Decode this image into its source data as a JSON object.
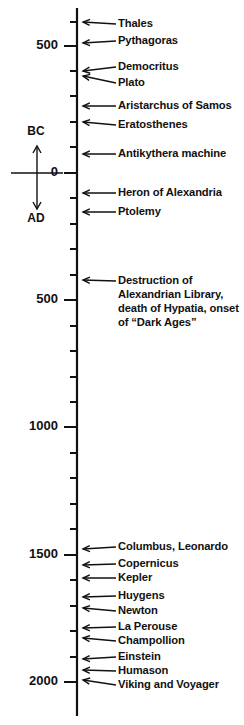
{
  "figure": {
    "kind": "timeline",
    "orientation": "vertical",
    "background_color": "#ffffff",
    "ink_color": "#111111"
  },
  "chart_data": {
    "type": "timeline",
    "title": "",
    "subtitle": "",
    "xlabel": "",
    "ylabel": "",
    "axis": {
      "orientation": "vertical",
      "direction": "top-is-oldest",
      "range_start_year": -700,
      "range_end_year": 2060,
      "unit": "year",
      "major_tick_interval": 500,
      "minor_tick_interval": 100,
      "grid": false,
      "legend": false,
      "era_divider_year": 0
    },
    "era_indicator": {
      "above_label": "BC",
      "below_label": "AD",
      "zero_label": "0"
    },
    "tick_labels": [
      {
        "label": "500",
        "year": -500,
        "major": true
      },
      {
        "label": "0",
        "year": 0,
        "major": true
      },
      {
        "label": "500",
        "year": 500,
        "major": true
      },
      {
        "label": "1000",
        "year": 1000,
        "major": true
      },
      {
        "label": "1500",
        "year": 1500,
        "major": true
      },
      {
        "label": "2000",
        "year": 2000,
        "major": true
      }
    ],
    "events": [
      {
        "label": "Thales",
        "year": -620,
        "lines": [
          "Thales"
        ]
      },
      {
        "label": "Pythagoras",
        "year": -550,
        "lines": [
          "Pythagoras"
        ]
      },
      {
        "label": "Democritus",
        "year": -440,
        "lines": [
          "Democritus"
        ]
      },
      {
        "label": "Plato",
        "year": -400,
        "lines": [
          "Plato"
        ]
      },
      {
        "label": "Aristarchus of Samos",
        "year": -280,
        "lines": [
          "Aristarchus of Samos"
        ]
      },
      {
        "label": "Eratosthenes",
        "year": -230,
        "lines": [
          "Eratosthenes"
        ]
      },
      {
        "label": "Antikythera machine",
        "year": -80,
        "lines": [
          "Antikythera machine"
        ]
      },
      {
        "label": "Heron of Alexandria",
        "year": 70,
        "lines": [
          "Heron of Alexandria"
        ]
      },
      {
        "label": "Ptolemy",
        "year": 150,
        "lines": [
          "Ptolemy"
        ]
      },
      {
        "label": "Destruction of Alexandrian Library, death of Hypatia, onset of “Dark Ages”",
        "year": 415,
        "lines": [
          "Destruction of",
          "Alexandrian Library,",
          "death of Hypatia, onset",
          "of “Dark Ages”"
        ]
      },
      {
        "label": "Columbus, Leonardo",
        "year": 1490,
        "lines": [
          "Columbus, Leonardo"
        ]
      },
      {
        "label": "Copernicus",
        "year": 1540,
        "lines": [
          "Copernicus"
        ]
      },
      {
        "label": "Kepler",
        "year": 1610,
        "lines": [
          "Kepler"
        ]
      },
      {
        "label": "Huygens",
        "year": 1670,
        "lines": [
          "Huygens"
        ]
      },
      {
        "label": "Newton",
        "year": 1690,
        "lines": [
          "Newton"
        ]
      },
      {
        "label": "La Perouse",
        "year": 1785,
        "lines": [
          "La Perouse"
        ]
      },
      {
        "label": "Champollion",
        "year": 1822,
        "lines": [
          "Champollion"
        ]
      },
      {
        "label": "Einstein",
        "year": 1915,
        "lines": [
          "Einstein"
        ]
      },
      {
        "label": "Humason",
        "year": 1930,
        "lines": [
          "Humason"
        ]
      },
      {
        "label": "Viking and Voyager",
        "year": 1977,
        "lines": [
          "Viking and Voyager"
        ]
      }
    ]
  },
  "layout": {
    "axis_x": 77,
    "axis_top_y": 8,
    "axis_bottom_y": 716,
    "year_zero_y": 173,
    "pixels_per_year": 0.2545,
    "major_tick_length": 13,
    "minor_tick_length": 7,
    "label_x": 118,
    "arrow_tip_x": 83,
    "arrow_tail_x": 116,
    "tick_text_x": 68
  },
  "rendered": {
    "ticks": [
      {
        "y": 22,
        "major": false
      },
      {
        "y": 46,
        "major": true,
        "text": "500",
        "text_y": 46
      },
      {
        "y": 71,
        "major": false
      },
      {
        "y": 96,
        "major": false
      },
      {
        "y": 122,
        "major": false
      },
      {
        "y": 147,
        "major": false
      },
      {
        "y": 173,
        "major": true,
        "text": "0",
        "text_y": 173
      },
      {
        "y": 198,
        "major": false
      },
      {
        "y": 224,
        "major": false
      },
      {
        "y": 249,
        "major": false
      },
      {
        "y": 275,
        "major": false
      },
      {
        "y": 300,
        "major": true,
        "text": "500",
        "text_y": 300
      },
      {
        "y": 326,
        "major": false
      },
      {
        "y": 351,
        "major": false
      },
      {
        "y": 377,
        "major": false
      },
      {
        "y": 402,
        "major": false
      },
      {
        "y": 427,
        "major": true,
        "text": "1000",
        "text_y": 427
      },
      {
        "y": 453,
        "major": false
      },
      {
        "y": 478,
        "major": false
      },
      {
        "y": 504,
        "major": false
      },
      {
        "y": 529,
        "major": false
      },
      {
        "y": 555,
        "major": true,
        "text": "1500",
        "text_y": 555
      },
      {
        "y": 580,
        "major": false
      },
      {
        "y": 606,
        "major": false
      },
      {
        "y": 631,
        "major": false
      },
      {
        "y": 657,
        "major": false
      },
      {
        "y": 682,
        "major": true,
        "text": "2000",
        "text_y": 682
      }
    ],
    "event_rows": [
      {
        "name": "thales",
        "tip_y": 22,
        "text_y": 24,
        "text_x": 118,
        "lines": [
          "Thales"
        ]
      },
      {
        "name": "pythagoras",
        "tip_y": 43,
        "text_y": 41,
        "text_x": 118,
        "lines": [
          "Pythagoras"
        ]
      },
      {
        "name": "democritus",
        "tip_y": 71,
        "text_y": 67,
        "text_x": 118,
        "lines": [
          "Democritus"
        ]
      },
      {
        "name": "plato",
        "tip_y": 76,
        "text_y": 83,
        "text_x": 118,
        "lines": [
          "Plato"
        ]
      },
      {
        "name": "aristarchus",
        "tip_y": 106,
        "text_y": 106,
        "text_x": 118,
        "lines": [
          "Aristarchus of Samos"
        ]
      },
      {
        "name": "eratosthenes",
        "tip_y": 122,
        "text_y": 125,
        "text_x": 118,
        "lines": [
          "Eratosthenes"
        ]
      },
      {
        "name": "antikythera",
        "tip_y": 154,
        "text_y": 154,
        "text_x": 118,
        "lines": [
          "Antikythera machine"
        ]
      },
      {
        "name": "heron",
        "tip_y": 193,
        "text_y": 193,
        "text_x": 118,
        "lines": [
          "Heron of Alexandria"
        ]
      },
      {
        "name": "ptolemy",
        "tip_y": 212,
        "text_y": 212,
        "text_x": 118,
        "lines": [
          "Ptolemy"
        ]
      },
      {
        "name": "alexandria",
        "tip_y": 280,
        "text_y": 281,
        "text_x": 118,
        "lines": [
          "Destruction of",
          "Alexandrian Library,",
          "death of Hypatia, onset",
          "of “Dark Ages”"
        ]
      },
      {
        "name": "columbus",
        "tip_y": 549,
        "text_y": 547,
        "text_x": 118,
        "lines": [
          "Columbus, Leonardo"
        ]
      },
      {
        "name": "copernicus",
        "tip_y": 565,
        "text_y": 564,
        "text_x": 118,
        "lines": [
          "Copernicus"
        ]
      },
      {
        "name": "kepler",
        "tip_y": 578,
        "text_y": 578,
        "text_x": 118,
        "lines": [
          "Kepler"
        ]
      },
      {
        "name": "huygens",
        "tip_y": 597,
        "text_y": 596,
        "text_x": 118,
        "lines": [
          "Huygens"
        ]
      },
      {
        "name": "newton",
        "tip_y": 608,
        "text_y": 611,
        "text_x": 118,
        "lines": [
          "Newton"
        ]
      },
      {
        "name": "la-perouse",
        "tip_y": 628,
        "text_y": 627,
        "text_x": 118,
        "lines": [
          "La Perouse"
        ]
      },
      {
        "name": "champollion",
        "tip_y": 638,
        "text_y": 641,
        "text_x": 118,
        "lines": [
          "Champollion"
        ]
      },
      {
        "name": "einstein",
        "tip_y": 659,
        "text_y": 657,
        "text_x": 118,
        "lines": [
          "Einstein"
        ]
      },
      {
        "name": "humason",
        "tip_y": 670,
        "text_y": 671,
        "text_x": 118,
        "lines": [
          "Humason"
        ]
      },
      {
        "name": "viking",
        "tip_y": 680,
        "text_y": 685,
        "text_x": 118,
        "lines": [
          "Viking and Voyager"
        ]
      }
    ],
    "era_indicator": {
      "bc_text": "BC",
      "bc_x": 36,
      "bc_y": 132,
      "ad_text": "AD",
      "ad_x": 36,
      "ad_y": 219,
      "vert_x": 37,
      "vert_top_y": 146,
      "vert_bottom_y": 209,
      "horiz_y": 173,
      "horiz_left_x": 11,
      "horiz_right_x": 63
    }
  }
}
